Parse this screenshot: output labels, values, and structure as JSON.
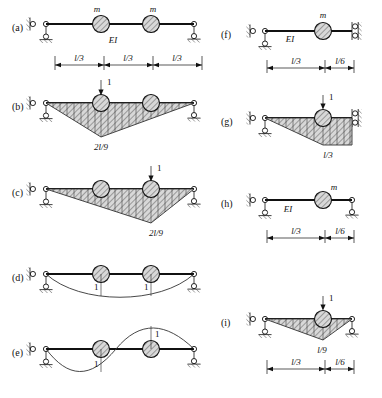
{
  "figure": {
    "type": "structural-dynamics-beam-diagram",
    "panel_count": 9,
    "symbols": {
      "mass": "m",
      "flexural_rigidity": "EI",
      "unit_load": "1"
    }
  },
  "panels": [
    {
      "id": "a",
      "label": "(a)",
      "kind": "beam-model",
      "mass_labels": [
        "m",
        "m"
      ],
      "rigidity_label": "EI",
      "dimensions": [
        "l/3",
        "l/3",
        "l/3"
      ],
      "supports": [
        "pin-roller",
        "roller"
      ]
    },
    {
      "id": "b",
      "label": "(b)",
      "kind": "influence-line",
      "load_label": "1",
      "ordinate_label": "2l/9",
      "supports": [
        "pin-roller",
        "roller"
      ]
    },
    {
      "id": "c",
      "label": "(c)",
      "kind": "influence-line",
      "load_label": "1",
      "ordinate_label": "2l/9",
      "supports": [
        "pin-roller",
        "roller"
      ]
    },
    {
      "id": "d",
      "label": "(d)",
      "kind": "mode-shape",
      "amplitude_labels": [
        "1",
        "1"
      ],
      "supports": [
        "pin-roller",
        "roller"
      ]
    },
    {
      "id": "e",
      "label": "(e)",
      "kind": "mode-shape",
      "amplitude_labels": [
        "1",
        "1"
      ],
      "supports": [
        "pin-roller",
        "roller"
      ]
    },
    {
      "id": "f",
      "label": "(f)",
      "kind": "beam-model",
      "mass_labels": [
        "m"
      ],
      "rigidity_label": "EI",
      "dimensions": [
        "l/3",
        "l/6"
      ],
      "supports": [
        "pin-roller",
        "guided-double-roller"
      ]
    },
    {
      "id": "g",
      "label": "(g)",
      "kind": "influence-line",
      "load_label": "1",
      "ordinate_label": "l/3",
      "supports": [
        "pin-roller",
        "guided-double-roller"
      ]
    },
    {
      "id": "h",
      "label": "(h)",
      "kind": "beam-model",
      "mass_labels": [
        "m"
      ],
      "rigidity_label": "EI",
      "dimensions": [
        "l/3",
        "l/6"
      ],
      "supports": [
        "pin-roller",
        "roller"
      ]
    },
    {
      "id": "i",
      "label": "(i)",
      "kind": "influence-line",
      "load_label": "1",
      "ordinate_label": "l/9",
      "dimensions": [
        "l/3",
        "l/6"
      ],
      "supports": [
        "pin-roller",
        "roller"
      ]
    }
  ]
}
